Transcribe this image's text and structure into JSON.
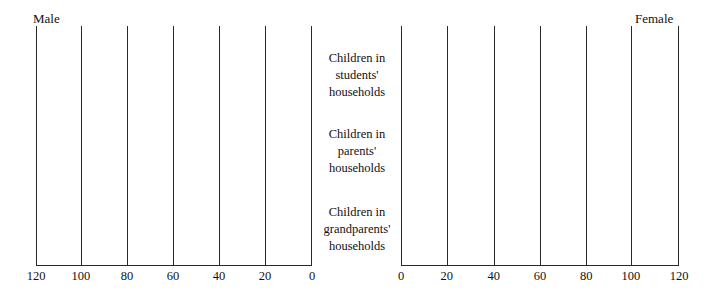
{
  "chart_data": {
    "type": "bar",
    "title": "",
    "subtitle": "",
    "orientation": "horizontal",
    "layout": "population-pyramid",
    "grid": true,
    "legend_position": "top-outside",
    "xlabel": "",
    "ylabel": "",
    "categories": [
      "Children in students' households",
      "Children in parents' households",
      "Children in grandparents' households"
    ],
    "category_lines": [
      [
        "Children in",
        "students'",
        "households"
      ],
      [
        "Children in",
        "parents'",
        "households"
      ],
      [
        "Children in",
        "grandparents'",
        "households"
      ]
    ],
    "series": [
      {
        "name": "Male",
        "side": "left",
        "values": [
          0,
          0,
          0
        ],
        "xlim": [
          0,
          120
        ],
        "tick_values": [
          120,
          100,
          80,
          60,
          40,
          20,
          0
        ],
        "tick_labels": [
          "120",
          "100",
          "80",
          "60",
          "40",
          "20",
          "0"
        ],
        "tick_positions_pct": [
          0,
          16.3,
          33.0,
          49.6,
          66.3,
          83.0,
          100
        ]
      },
      {
        "name": "Female",
        "side": "right",
        "values": [
          0,
          0,
          0
        ],
        "xlim": [
          0,
          120
        ],
        "tick_values": [
          0,
          20,
          40,
          60,
          80,
          100,
          120
        ],
        "tick_labels": [
          "0",
          "20",
          "40",
          "60",
          "80",
          "100",
          "120"
        ],
        "tick_positions_pct": [
          0,
          16.5,
          33.4,
          50.0,
          66.6,
          82.7,
          100
        ]
      }
    ],
    "annotations": [],
    "colors": {
      "axis": "#2a2a2a",
      "grid": "#2a2a2a",
      "text": "#111111",
      "background": "#ffffff",
      "bar": "#4d4d4d"
    }
  },
  "headers": {
    "male": "Male",
    "female": "Female"
  }
}
